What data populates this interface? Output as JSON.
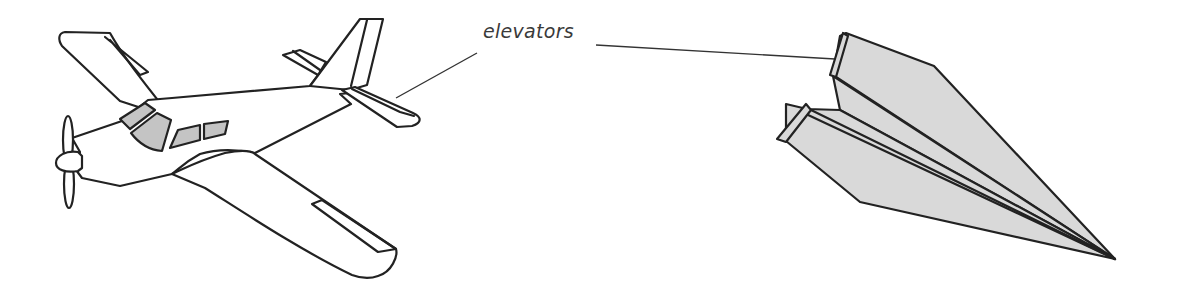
{
  "diagram": {
    "subjects": [
      {
        "id": "airplane",
        "description": "Propeller airplane line drawing"
      },
      {
        "id": "paper-airplane",
        "description": "Paper airplane with folded-up elevator tabs"
      }
    ],
    "labels": {
      "elevators": "elevators"
    },
    "colors": {
      "line": "#222222",
      "window_fill": "#c4c4c4",
      "paper_fill": "#d9d9d9",
      "label_text": "#3a3a3a",
      "background": "#ffffff"
    }
  }
}
